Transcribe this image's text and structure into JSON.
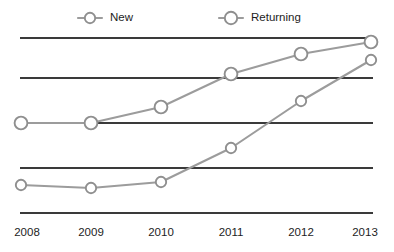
{
  "chart_data": {
    "type": "line",
    "title": "",
    "subtitle": "",
    "xlabel": "",
    "ylabel": "",
    "categories": [
      "2008",
      "2009",
      "2010",
      "2011",
      "2012",
      "2013"
    ],
    "x": [
      2008,
      2009,
      2010,
      2011,
      2012,
      2013
    ],
    "series": [
      {
        "name": "New",
        "color": "#9c9c9c",
        "marker": "open-circle",
        "marker_size": 5.2,
        "values": [
          16,
          15,
          18,
          37,
          64,
          87
        ]
      },
      {
        "name": "Returning",
        "color": "#9c9c9c",
        "marker": "open-circle",
        "marker_size": 6.4,
        "values": [
          50,
          50,
          59,
          78,
          89,
          95
        ]
      }
    ],
    "ylim": [
      0,
      100
    ],
    "xlim": [
      2008,
      2013
    ],
    "ygrid_values": [
      0,
      25,
      50,
      75,
      100
    ],
    "grid": "horizontal",
    "grid_color": "#3a3a3a",
    "y_axis_labels_visible": false,
    "legend": {
      "position": "top",
      "entries": [
        {
          "label": "New",
          "marker": "open-circle-with-dashes"
        },
        {
          "label": "Returning",
          "marker": "open-circle-with-dashes"
        }
      ]
    },
    "background": "#ffffff"
  },
  "axis": {
    "x_tick_labels": [
      "2008",
      "2009",
      "2010",
      "2011",
      "2012",
      "2013"
    ]
  },
  "legend": {
    "new_label": "New",
    "returning_label": "Returning"
  },
  "geometry": {
    "x_positions": [
      21,
      91,
      161,
      231,
      301,
      371
    ],
    "gridline_y": [
      38,
      78,
      123,
      168,
      213
    ],
    "grid_x_start": 20,
    "grid_x_end": 373,
    "series_new_y": [
      185,
      188,
      182,
      148,
      101,
      60
    ],
    "series_returning_y": [
      123,
      123,
      107,
      74,
      54,
      42
    ],
    "tick_label_y": 236,
    "legend_y": 18,
    "legend_new_marker_x": 87,
    "legend_new_text_x": 104,
    "legend_returning_marker_x": 228,
    "legend_returning_text_x": 245
  }
}
